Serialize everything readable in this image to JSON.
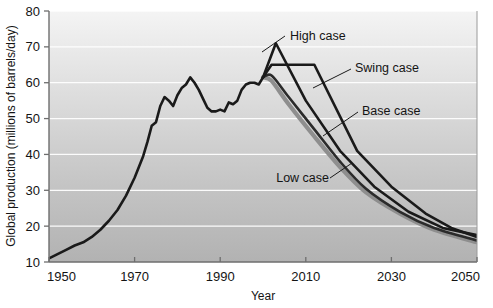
{
  "chart_data": {
    "type": "line",
    "title": "",
    "xlabel": "Year",
    "ylabel": "Global production (millions of barrels/day)",
    "xlim": [
      1950,
      2050
    ],
    "ylim": [
      10,
      80
    ],
    "xticks": [
      1950,
      1970,
      1990,
      2010,
      2030,
      2050
    ],
    "yticks": [
      10,
      20,
      30,
      40,
      50,
      60,
      70,
      80
    ],
    "grid": "horizontal",
    "legend_position": "inline-annotations",
    "background": "vertical gray gradient, white gridlines",
    "colors": {
      "history": "#1a1a1a",
      "high_case": "#1a1a1a",
      "swing_case": "#1a1a1a",
      "base_case": "#2b2b2b",
      "low_case": "#8e8e8e",
      "gridline": "#ffffff",
      "plot_bg_top": "#f2f2f2",
      "plot_bg_bottom": "#b5b5b5",
      "axis": "#6b6b6b"
    },
    "series": [
      {
        "name": "History",
        "label": "",
        "color": "#1a1a1a",
        "points": [
          [
            1950,
            11.0
          ],
          [
            1952,
            12.2
          ],
          [
            1954,
            13.4
          ],
          [
            1956,
            14.6
          ],
          [
            1958,
            15.5
          ],
          [
            1960,
            17.0
          ],
          [
            1962,
            19.0
          ],
          [
            1964,
            21.5
          ],
          [
            1966,
            24.5
          ],
          [
            1968,
            28.5
          ],
          [
            1970,
            33.5
          ],
          [
            1971,
            36.5
          ],
          [
            1972,
            39.5
          ],
          [
            1973,
            43.5
          ],
          [
            1974,
            48.0
          ],
          [
            1975,
            49.0
          ],
          [
            1976,
            53.5
          ],
          [
            1977,
            56.0
          ],
          [
            1978,
            55.0
          ],
          [
            1979,
            53.5
          ],
          [
            1980,
            56.5
          ],
          [
            1981,
            58.5
          ],
          [
            1982,
            59.5
          ],
          [
            1983,
            61.5
          ],
          [
            1984,
            60.0
          ],
          [
            1985,
            58.0
          ],
          [
            1986,
            55.5
          ],
          [
            1987,
            53.0
          ],
          [
            1988,
            52.0
          ],
          [
            1989,
            52.0
          ],
          [
            1990,
            52.5
          ],
          [
            1991,
            52.0
          ],
          [
            1992,
            54.5
          ],
          [
            1993,
            54.0
          ],
          [
            1994,
            55.0
          ],
          [
            1995,
            58.0
          ],
          [
            1996,
            59.5
          ],
          [
            1997,
            60.0
          ],
          [
            1998,
            60.0
          ],
          [
            1999,
            59.5
          ],
          [
            2000,
            61.5
          ]
        ]
      },
      {
        "name": "High case",
        "label": "High case",
        "color": "#1a1a1a",
        "points": [
          [
            2000,
            61.5
          ],
          [
            2003,
            71.0
          ],
          [
            2010,
            55.0
          ],
          [
            2018,
            41.0
          ],
          [
            2026,
            31.0
          ],
          [
            2034,
            24.0
          ],
          [
            2042,
            19.5
          ],
          [
            2050,
            17.5
          ]
        ]
      },
      {
        "name": "Swing case",
        "label": "Swing case",
        "color": "#1a1a1a",
        "points": [
          [
            2000,
            61.5
          ],
          [
            2002,
            65.0
          ],
          [
            2012,
            65.0
          ],
          [
            2022,
            41.0
          ],
          [
            2030,
            31.0
          ],
          [
            2038,
            23.5
          ],
          [
            2044,
            19.5
          ],
          [
            2050,
            17.0
          ]
        ]
      },
      {
        "name": "Base case",
        "label": "Base case",
        "color": "#2b2b2b",
        "points": [
          [
            2000,
            61.5
          ],
          [
            2002,
            62.0
          ],
          [
            2006,
            56.0
          ],
          [
            2012,
            47.0
          ],
          [
            2018,
            38.0
          ],
          [
            2024,
            30.5
          ],
          [
            2032,
            24.0
          ],
          [
            2040,
            19.5
          ],
          [
            2050,
            16.0
          ]
        ]
      },
      {
        "name": "Low case",
        "label": "Low case",
        "color": "#8e8e8e",
        "points": [
          [
            2000,
            61.5
          ],
          [
            2002,
            60.5
          ],
          [
            2006,
            54.0
          ],
          [
            2012,
            45.0
          ],
          [
            2018,
            36.5
          ],
          [
            2024,
            29.5
          ],
          [
            2032,
            23.5
          ],
          [
            2040,
            19.0
          ],
          [
            2050,
            15.5
          ]
        ]
      }
    ],
    "annotations": [
      {
        "text": "High case",
        "text_x": 290,
        "text_y": 40,
        "leader": [
          [
            285,
            36
          ],
          [
            262,
            52
          ]
        ]
      },
      {
        "text": "Swing case",
        "text_x": 355,
        "text_y": 72,
        "leader": [
          [
            351,
            69
          ],
          [
            313,
            88
          ]
        ]
      },
      {
        "text": "Base case",
        "text_x": 362,
        "text_y": 115,
        "leader": [
          [
            358,
            112
          ],
          [
            323,
            136
          ]
        ]
      },
      {
        "text": "Low case",
        "text_x": 283,
        "text_y": 182,
        "leader": [
          [
            330,
            178
          ],
          [
            352,
            163
          ]
        ]
      }
    ]
  },
  "axes": {
    "y_title": "Global production (millions of barrels/day)",
    "x_title": "Year",
    "y_tick_labels": [
      "80",
      "70",
      "60",
      "50",
      "40",
      "30",
      "20",
      "10"
    ],
    "x_tick_labels": [
      "1950",
      "1970",
      "1990",
      "2010",
      "2030",
      "2050"
    ]
  }
}
